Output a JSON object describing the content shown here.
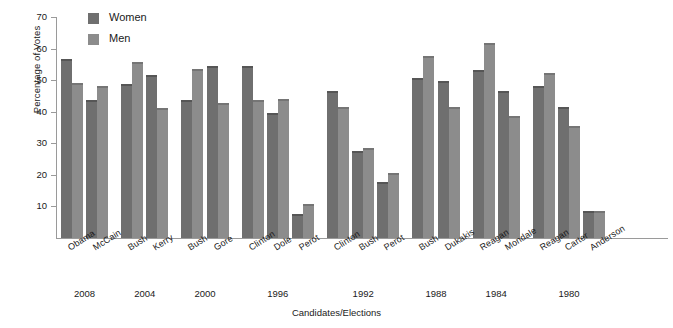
{
  "chart_data": {
    "type": "bar",
    "title": "",
    "xlabel": "Candidates/Elections",
    "ylabel": "Percentage of Votes",
    "ylim": [
      0,
      70
    ],
    "ytick_values": [
      10,
      20,
      30,
      40,
      50,
      60,
      70
    ],
    "ytick_labels": [
      "10",
      "20",
      "30",
      "40",
      "50",
      "60",
      "70"
    ],
    "grid": false,
    "legend_position": "top-left",
    "categories": [
      "Obama",
      "McCain",
      "Bush",
      "Kerry",
      "Bush",
      "Gore",
      "Clinton",
      "Dole",
      "Perot",
      "Clinton",
      "Bush",
      "Perot",
      "Bush",
      "Dukakis",
      "Reagan",
      "Mondale",
      "Reagan",
      "Carter",
      "Anderson"
    ],
    "series": [
      {
        "name": "Women",
        "color": "#6f6f6f",
        "values": [
          56,
          43,
          48,
          51,
          43,
          54,
          54,
          39,
          7,
          46,
          27,
          17,
          50,
          49,
          52.5,
          46,
          47.5,
          41,
          8
        ]
      },
      {
        "name": "Men",
        "color": "#8c8c8c",
        "values": [
          48.5,
          47.5,
          55,
          40.5,
          53,
          42,
          43,
          43.5,
          10,
          41,
          28,
          20,
          57,
          41,
          61,
          38,
          51.5,
          35,
          8
        ]
      }
    ],
    "groups": [
      {
        "year": "2008",
        "candidate_count": 2
      },
      {
        "year": "2004",
        "candidate_count": 2
      },
      {
        "year": "2000",
        "candidate_count": 2
      },
      {
        "year": "1996",
        "candidate_count": 3
      },
      {
        "year": "1992",
        "candidate_count": 3
      },
      {
        "year": "1988",
        "candidate_count": 2
      },
      {
        "year": "1984",
        "candidate_count": 2
      },
      {
        "year": "1980",
        "candidate_count": 3
      }
    ]
  },
  "legend": {
    "items": [
      {
        "label": "Women",
        "swatch": "women-swatch"
      },
      {
        "label": "Men",
        "swatch": "men-swatch"
      }
    ]
  },
  "axes": {
    "y_title": "Percentage of Votes",
    "x_title": "Candidates/Elections"
  }
}
